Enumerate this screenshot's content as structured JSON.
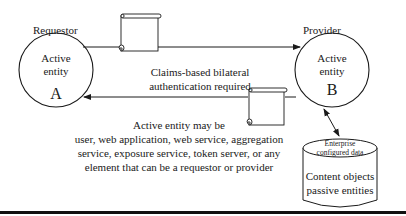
{
  "diagram": {
    "requestor": {
      "role_label": "Requestor",
      "entity_line1": "Active",
      "entity_line2": "entity",
      "letter": "A"
    },
    "provider": {
      "role_label": "Provider",
      "entity_line1": "Active",
      "entity_line2": "entity",
      "letter": "B"
    },
    "top_arrow_caption": {
      "line1": "Claims-based bilateral",
      "line2": "authentication required"
    },
    "bottom_caption": {
      "line1": "Active entity may be",
      "line2": "user, web application, web service, aggregation",
      "line3": "service, exposure service, token server, or any",
      "line4": "element that can be a requestor or provider"
    },
    "data_store": {
      "top_line1": "Enterprise",
      "top_line2": "configured data",
      "body_line1": "Content objects",
      "body_line2": "passive entities"
    },
    "icons": {
      "token_scroll_1": "scroll-icon",
      "token_scroll_2": "scroll-icon",
      "data_store_shape": "database-cylinder-icon"
    },
    "colors": {
      "stroke": "#1a1a1a",
      "background": "#ffffff",
      "bottom_bar": "#111111"
    }
  }
}
